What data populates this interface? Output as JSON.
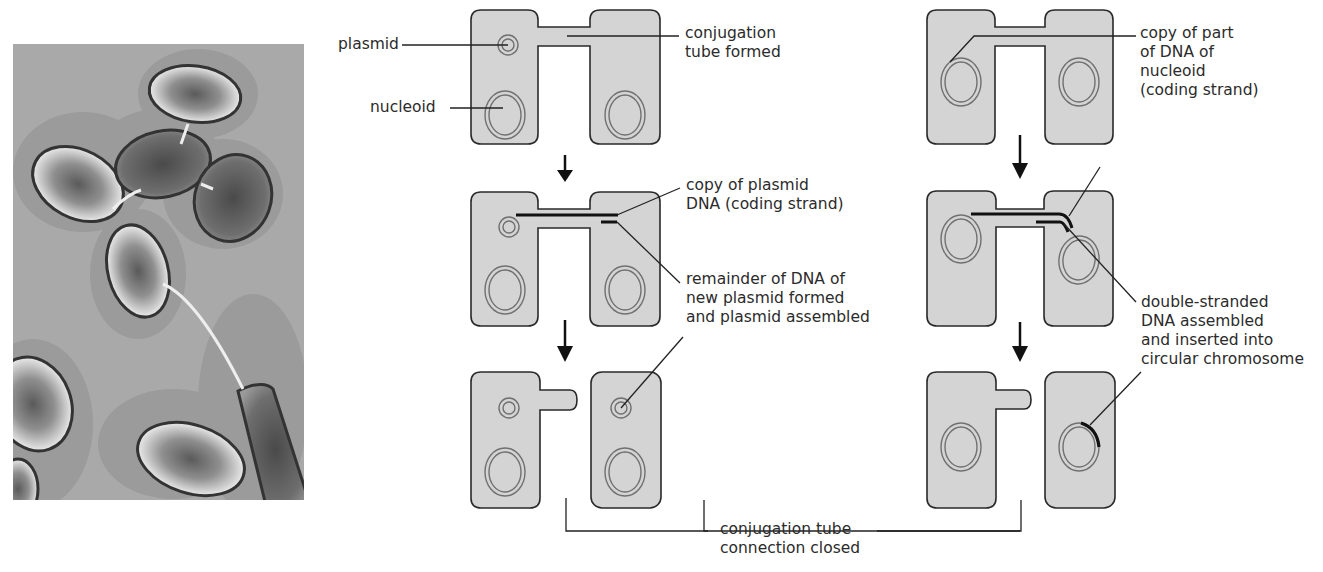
{
  "figure": {
    "photo": {
      "description": "Electron micrograph of bacteria connected by conjugation tubes (pili)",
      "background_color": "#a9a9a9",
      "halo_color": "#9a9a9a"
    },
    "colors": {
      "cell_fill": "#d4d4d4",
      "cell_outline": "#2a2a2a",
      "ring_color": "#707070",
      "dna_strand": "#111111",
      "text": "#2b2b2b"
    },
    "left_sequence": {
      "labels": {
        "plasmid": "plasmid",
        "nucleoid": "nucleoid",
        "conjugation_tube_line1": "conjugation",
        "conjugation_tube_line2": "tube formed",
        "copy_plasmid_line1": "copy of plasmid",
        "copy_plasmid_line2": "DNA (coding strand)",
        "remainder_line1": "remainder of DNA of",
        "remainder_line2": "new plasmid formed",
        "remainder_line3": "and plasmid assembled"
      }
    },
    "right_sequence": {
      "labels": {
        "copy_part_line1": "copy of part",
        "copy_part_line2": "of DNA of",
        "copy_part_line3": "nucleoid",
        "copy_part_line4": "(coding strand)",
        "double_line1": "double-stranded",
        "double_line2": "DNA assembled",
        "double_line3": "and inserted into",
        "double_line4": "circular chromosome"
      }
    },
    "bottom_label": {
      "line1": "conjugation tube",
      "line2": "connection closed"
    }
  }
}
